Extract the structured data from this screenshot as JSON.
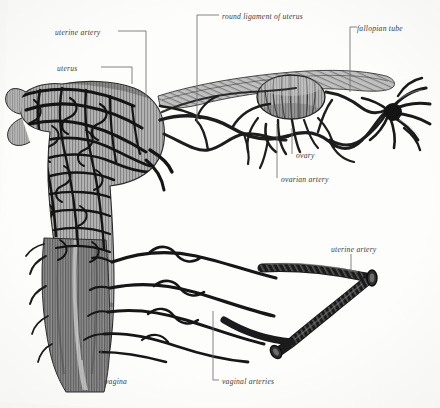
{
  "figure": {
    "style": "engraving",
    "ink_color": "#1d1d1d",
    "tissue_color": "#9a9a9a",
    "background_color": "#fdfdfc",
    "leader_color": "#6e6e6e"
  },
  "labels": [
    {
      "id": "uterine-artery-top",
      "text": "uterine artery",
      "x": 55,
      "y": 34,
      "align": "left"
    },
    {
      "id": "uterus",
      "text": "uterus",
      "x": 57,
      "y": 70,
      "align": "left"
    },
    {
      "id": "round-ligament",
      "text": "round ligament of uterus",
      "x": 222,
      "y": 18,
      "align": "left"
    },
    {
      "id": "fallopian-tube",
      "text": "fallopian tube",
      "x": 357,
      "y": 30,
      "align": "left"
    },
    {
      "id": "ovary",
      "text": "ovary",
      "x": 296,
      "y": 157,
      "align": "left"
    },
    {
      "id": "ovarian-artery",
      "text": "ovarian artery",
      "x": 281,
      "y": 181,
      "align": "left"
    },
    {
      "id": "uterine-artery-right",
      "text": "uterine artery",
      "x": 331,
      "y": 251,
      "align": "left"
    },
    {
      "id": "vagina",
      "text": "vagina",
      "x": 105,
      "y": 383,
      "align": "left"
    },
    {
      "id": "vaginal-arteries",
      "text": "vaginal arteries",
      "x": 222,
      "y": 383,
      "align": "left"
    }
  ],
  "leaders": [
    {
      "id": "leader-uterine-artery-top",
      "points": "118,31 146,31 146,97"
    },
    {
      "id": "leader-uterus",
      "points": "101,67 132,67 132,84"
    },
    {
      "id": "leader-round-ligament",
      "points": "219,15 197,15 197,122"
    },
    {
      "id": "leader-fallopian-tube",
      "points": "357,27 350,27 350,92"
    },
    {
      "id": "leader-ovary",
      "points": "292,154 292,128"
    },
    {
      "id": "leader-ovarian-artery",
      "points": "277,178 277,124"
    },
    {
      "id": "leader-uterine-artery-right",
      "points": "351,254 351,272"
    },
    {
      "id": "leader-vagina",
      "points": "101,380 101,349"
    },
    {
      "id": "leader-vaginal-arteries",
      "points": "219,380 213,380 213,311"
    }
  ],
  "structures": [
    {
      "id": "uterus-body",
      "name": "uterus",
      "description": "pear-shaped uterine body with dense tortuous arterial plexus"
    },
    {
      "id": "vagina-column",
      "name": "vagina",
      "description": "vertical striated vaginal canal below the cervix"
    },
    {
      "id": "ovary-mass",
      "name": "ovary",
      "description": "oval striated ovary suspended in the broad ligament"
    },
    {
      "id": "fallopian-tube",
      "name": "fallopian tube",
      "description": "coiled tube ending in the fimbriated infundibulum"
    },
    {
      "id": "round-ligament",
      "name": "round ligament of uterus",
      "description": "flat band running laterally above the tube"
    },
    {
      "id": "ovarian-artery",
      "name": "ovarian artery",
      "description": "tortuous artery approaching the ovary from the arcade"
    },
    {
      "id": "uterine-artery",
      "name": "uterine artery",
      "description": "thick coiled trunk ascending to the uterus"
    },
    {
      "id": "vaginal-arteries",
      "name": "vaginal arteries",
      "description": "long wavy branches crossing to the vaginal wall"
    },
    {
      "id": "arterial-arcade",
      "name": "arterial arcade",
      "description": "anastomosing polygonal vessel loops in the broad ligament"
    },
    {
      "id": "vessel-trunk",
      "name": "vessel trunk",
      "description": "thick Y-shaped cut vessel trunk at lower right"
    }
  ]
}
